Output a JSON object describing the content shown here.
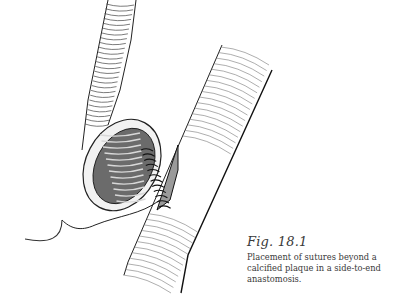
{
  "figure": {
    "label": "Fig. 18.1",
    "caption": "Placement of sutures beyond a calcified plaque in a side-to-end anastomosis.",
    "illustration": "surgical-anastomosis-drawing"
  }
}
